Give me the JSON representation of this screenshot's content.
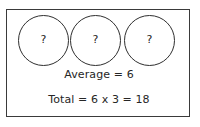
{
  "diagram": {
    "title_visible": false,
    "border_color": "#3a3a3a",
    "background_color": "#ffffff",
    "text_color": "#262626",
    "circles": [
      {
        "label": "?"
      },
      {
        "label": "?"
      },
      {
        "label": "?"
      }
    ],
    "lines": [
      {
        "text": "Average = 6"
      },
      {
        "text": "Total = 6 x 3 = 18"
      }
    ]
  }
}
